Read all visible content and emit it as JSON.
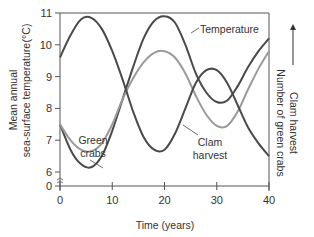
{
  "chart_data": {
    "type": "line",
    "title": "",
    "xlabel": "Time (years)",
    "ylabel_left": [
      "Mean annual",
      "sea-surface temperature",
      "(°C)"
    ],
    "ylabel_right": [
      "Clam harvest",
      "Number of green crabs"
    ],
    "right_axis_arrow": "up-arrow",
    "xlim": [
      0,
      40
    ],
    "ylim": [
      0,
      11
    ],
    "y_axis_break": "between 0 and 6",
    "x_ticks": [
      0,
      10,
      20,
      30,
      40
    ],
    "x_tick_labels": [
      "0",
      "10",
      "20",
      "30",
      "40"
    ],
    "y_ticks": [
      0,
      6,
      7,
      8,
      9,
      10,
      11
    ],
    "y_tick_labels": [
      "0",
      "6",
      "7",
      "8",
      "9",
      "10",
      "11"
    ],
    "grid": false,
    "series": [
      {
        "name": "Temperature",
        "color": "#4a4a4a",
        "x": [
          0,
          2,
          4,
          6,
          8,
          10,
          12,
          14,
          16,
          18,
          20,
          22,
          24,
          26,
          28,
          30,
          32,
          34,
          36,
          38,
          40
        ],
        "values": [
          7.5,
          6.7,
          6.25,
          6.15,
          6.5,
          7.3,
          8.3,
          9.3,
          10.2,
          10.75,
          10.9,
          10.7,
          10.0,
          9.1,
          8.5,
          8.2,
          8.25,
          8.7,
          9.3,
          9.8,
          10.2
        ]
      },
      {
        "name": "Green crabs",
        "color": "#9a9a9a",
        "x": [
          0,
          2,
          4,
          6,
          8,
          10,
          12,
          14,
          16,
          18,
          20,
          22,
          24,
          26,
          28,
          30,
          32,
          34,
          36,
          38,
          40
        ],
        "values": [
          7.5,
          7.0,
          6.7,
          6.65,
          6.9,
          7.5,
          8.3,
          8.95,
          9.45,
          9.75,
          9.8,
          9.6,
          9.1,
          8.4,
          7.8,
          7.45,
          7.45,
          7.9,
          8.6,
          9.25,
          9.8
        ]
      },
      {
        "name": "Clam harvest",
        "color": "#4a4a4a",
        "x": [
          0,
          2,
          4,
          6,
          8,
          10,
          12,
          14,
          16,
          18,
          20,
          22,
          24,
          26,
          28,
          30,
          32,
          34,
          36,
          38,
          40
        ],
        "values": [
          9.6,
          10.3,
          10.8,
          10.85,
          10.5,
          9.8,
          8.9,
          7.9,
          7.1,
          6.7,
          6.7,
          7.2,
          8.0,
          8.8,
          9.2,
          9.2,
          8.8,
          8.1,
          7.4,
          6.9,
          6.5
        ]
      }
    ],
    "annotations": [
      {
        "text": "Temperature",
        "target": "Temperature",
        "lines": [
          "Temperature"
        ]
      },
      {
        "text": "Green crabs",
        "target": "Green crabs",
        "lines": [
          "Green",
          "crabs"
        ]
      },
      {
        "text": "Clam harvest",
        "target": "Clam harvest",
        "lines": [
          "Clam",
          "harvest"
        ]
      }
    ]
  }
}
